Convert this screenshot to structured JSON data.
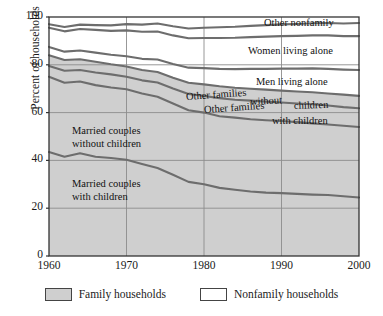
{
  "chart_data": {
    "type": "area",
    "title": "",
    "subtitle": "",
    "xlabel": "",
    "ylabel": "Percent of households",
    "xlim": [
      1960,
      2000
    ],
    "ylim": [
      0,
      100
    ],
    "xticks": [
      "1960",
      "1970",
      "1980",
      "1990",
      "2000"
    ],
    "yticks": [
      "0",
      "20",
      "40",
      "60",
      "80",
      "100"
    ],
    "grid": true,
    "stacked": true,
    "legend_position": "bottom",
    "x": [
      1960,
      1962,
      1964,
      1966,
      1968,
      1970,
      1972,
      1974,
      1976,
      1978,
      1980,
      1982,
      1984,
      1986,
      1988,
      1990,
      1992,
      1994,
      1996,
      1998,
      2000
    ],
    "series": [
      {
        "name": "Married couples with children",
        "group": "Family households",
        "values": [
          43.5,
          41.5,
          43.0,
          41.5,
          41.0,
          40.3,
          38.5,
          36.8,
          34.0,
          31.0,
          30.0,
          28.5,
          27.7,
          27.0,
          26.5,
          26.3,
          26.0,
          25.7,
          25.5,
          25.0,
          24.5
        ]
      },
      {
        "name": "Married couples without children",
        "group": "Family households",
        "values": [
          31.5,
          31.0,
          30.0,
          30.0,
          29.5,
          29.5,
          29.5,
          29.8,
          29.8,
          30.0,
          30.0,
          30.0,
          30.2,
          30.2,
          30.3,
          30.2,
          30.0,
          29.8,
          29.5,
          29.5,
          29.5
        ]
      },
      {
        "name": "Other families with children",
        "group": "Family households",
        "values": [
          4.5,
          5.0,
          4.8,
          5.3,
          5.5,
          5.2,
          5.5,
          6.0,
          6.3,
          6.8,
          7.0,
          7.5,
          7.5,
          7.8,
          7.8,
          7.7,
          7.8,
          8.0,
          8.0,
          7.8,
          7.8
        ]
      },
      {
        "name": "Other families without children",
        "group": "Family households",
        "values": [
          4.5,
          4.5,
          4.5,
          4.5,
          4.2,
          4.3,
          4.3,
          4.4,
          4.5,
          4.7,
          4.8,
          5.0,
          5.0,
          5.0,
          5.0,
          5.0,
          5.0,
          5.0,
          5.0,
          5.2,
          5.2
        ]
      },
      {
        "name": "Men living alone",
        "group": "Nonfamily households",
        "values": [
          3.5,
          3.5,
          3.7,
          3.8,
          4.0,
          4.3,
          4.7,
          5.2,
          5.7,
          6.3,
          6.8,
          7.3,
          7.8,
          8.3,
          8.7,
          9.2,
          9.6,
          10.0,
          10.3,
          10.5,
          10.8
        ]
      },
      {
        "name": "Women living alone",
        "group": "Nonfamily households",
        "values": [
          8.0,
          8.5,
          9.0,
          9.5,
          10.0,
          10.8,
          11.3,
          11.7,
          12.0,
          12.3,
          12.6,
          12.9,
          13.1,
          13.3,
          13.5,
          13.6,
          13.7,
          13.8,
          14.0,
          14.0,
          14.2
        ]
      },
      {
        "name": "Other nonfamily",
        "group": "Nonfamily households",
        "values": [
          1.5,
          1.8,
          1.8,
          2.0,
          2.3,
          2.6,
          3.0,
          3.4,
          3.8,
          4.1,
          4.3,
          4.5,
          4.6,
          4.7,
          4.8,
          4.9,
          5.0,
          5.1,
          5.2,
          5.3,
          5.5
        ]
      }
    ],
    "cumulative_top_lines": {
      "married_with_children": [
        43.5,
        41.5,
        43.0,
        41.5,
        41.0,
        40.3,
        38.5,
        36.8,
        34.0,
        31.0,
        30.0,
        28.5,
        27.7,
        27.0,
        26.5,
        26.3,
        26.0,
        25.7,
        25.5,
        25.0,
        24.5
      ],
      "married_without_children": [
        75.0,
        72.5,
        73.0,
        71.5,
        70.5,
        69.8,
        68.0,
        66.6,
        63.8,
        61.0,
        60.0,
        58.5,
        57.9,
        57.2,
        56.8,
        56.5,
        56.0,
        55.5,
        55.0,
        54.5,
        54.0
      ],
      "other_families_with_children": [
        79.5,
        77.5,
        77.8,
        76.8,
        76.0,
        75.0,
        73.5,
        72.6,
        70.1,
        67.8,
        67.0,
        66.0,
        65.4,
        65.0,
        64.6,
        64.2,
        63.8,
        63.5,
        63.0,
        62.3,
        61.8
      ],
      "other_families_without_children": [
        84.0,
        82.0,
        82.3,
        81.3,
        80.2,
        79.3,
        77.8,
        77.0,
        74.6,
        72.5,
        71.8,
        71.0,
        70.4,
        70.0,
        69.6,
        69.2,
        68.8,
        68.5,
        68.0,
        67.5,
        67.0
      ],
      "men_living_alone": [
        87.5,
        85.5,
        86.0,
        85.1,
        84.2,
        83.6,
        82.5,
        82.2,
        80.3,
        78.8,
        78.6,
        78.3,
        78.2,
        78.3,
        78.3,
        78.4,
        78.4,
        78.5,
        78.3,
        78.0,
        77.8
      ],
      "women_living_alone": [
        95.5,
        94.0,
        95.0,
        94.6,
        94.2,
        94.4,
        93.8,
        93.9,
        92.3,
        91.1,
        91.2,
        91.2,
        91.3,
        91.6,
        91.8,
        92.0,
        92.1,
        92.3,
        92.3,
        92.0,
        92.0
      ],
      "other_nonfamily": [
        97.0,
        95.8,
        96.8,
        96.6,
        96.5,
        97.0,
        96.8,
        97.3,
        96.1,
        95.2,
        95.5,
        95.7,
        95.9,
        96.3,
        96.6,
        96.9,
        97.1,
        97.4,
        97.5,
        97.3,
        97.5
      ]
    },
    "annotations": [
      {
        "text": "Other nonfamily",
        "x": 264,
        "y": 17
      },
      {
        "text": "Women living alone",
        "x": 248,
        "y": 45
      },
      {
        "text": "Men living alone",
        "x": 256,
        "y": 76
      },
      {
        "text": "Other families",
        "x": 186,
        "y": 91
      },
      {
        "text": "without",
        "x": 250,
        "y": 96
      },
      {
        "text": "children",
        "x": 294,
        "y": 100
      },
      {
        "text": "Other families",
        "x": 204,
        "y": 104
      },
      {
        "text": "with children",
        "x": 272,
        "y": 115
      },
      {
        "text": "Married couples",
        "x": 72,
        "y": 125
      },
      {
        "text": "without children",
        "x": 72,
        "y": 138
      },
      {
        "text": "Married couples",
        "x": 72,
        "y": 178
      },
      {
        "text": "with children",
        "x": 72,
        "y": 191
      }
    ],
    "legend": [
      {
        "label": "Family households",
        "swatch": "gray"
      },
      {
        "label": "Nonfamily households",
        "swatch": "white"
      }
    ],
    "colors": {
      "family_fill": "#cfcfcf",
      "nonfamily_fill": "#ffffff",
      "line": "#6d6d6d",
      "axis": "#333333",
      "grid": "#8c8c8c",
      "text": "#1a1a1a"
    }
  }
}
